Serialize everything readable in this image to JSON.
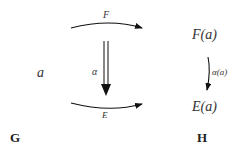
{
  "diagram": {
    "source_object": "a",
    "functor_top_label": "F",
    "functor_bottom_label": "E",
    "natural_transformation_label": "α",
    "target_top_object": "F(a)",
    "target_bottom_object": "E(a)",
    "component_label": "α(a)",
    "source_category": "G",
    "target_category": "H"
  }
}
